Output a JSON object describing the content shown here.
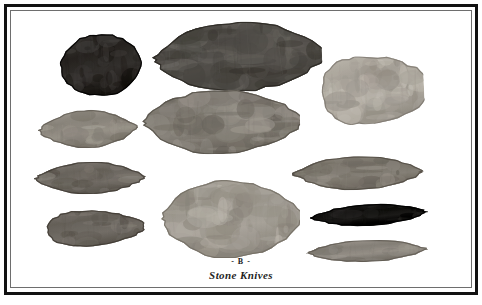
{
  "plate": {
    "letter": "- B -",
    "title": "Stone Knives",
    "background_color": "#ffffff",
    "frame_color": "#111111",
    "frame_inner_color": "#6e6e6e"
  },
  "artifacts": [
    {
      "name": "ovate-blade-dark-top-left",
      "label": "dark ovate blade",
      "tone": "very dark gray",
      "color": "#2e2b28",
      "x": 60,
      "y": 34,
      "width": 82,
      "height": 62,
      "rotation": -4
    },
    {
      "name": "large-leaf-blade-top-center",
      "label": "large leaf-shaped biface",
      "tone": "dark mottled gray",
      "color": "#56534e",
      "x": 150,
      "y": 22,
      "width": 172,
      "height": 70,
      "rotation": -2
    },
    {
      "name": "teardrop-blade-right",
      "label": "teardrop blade",
      "tone": "light gray",
      "color": "#a9a49b",
      "x": 312,
      "y": 56,
      "width": 112,
      "height": 68,
      "rotation": -3
    },
    {
      "name": "elongate-blade-left-upper",
      "label": "elongate blade, tip right",
      "tone": "medium gray",
      "color": "#8d887f",
      "x": 38,
      "y": 110,
      "width": 100,
      "height": 38,
      "rotation": -2
    },
    {
      "name": "large-ovate-blade-center",
      "label": "large ovate blade",
      "tone": "medium gray",
      "color": "#807b73",
      "x": 140,
      "y": 90,
      "width": 160,
      "height": 64,
      "rotation": -1
    },
    {
      "name": "lanceolate-blade-left-middle",
      "label": "slender lanceolate blade",
      "tone": "medium-dark gray",
      "color": "#6f6a63",
      "x": 34,
      "y": 162,
      "width": 112,
      "height": 32,
      "rotation": -1
    },
    {
      "name": "lanceolate-blade-right-middle",
      "label": "long pointed lanceolate blade",
      "tone": "medium gray",
      "color": "#7d786f",
      "x": 292,
      "y": 156,
      "width": 132,
      "height": 34,
      "rotation": -1
    },
    {
      "name": "wedge-blade-bottom-left",
      "label": "wedge-shaped blade",
      "tone": "medium-dark gray",
      "color": "#6b665f",
      "x": 46,
      "y": 206,
      "width": 100,
      "height": 44,
      "rotation": -2
    },
    {
      "name": "large-ovate-biface-bottom-center",
      "label": "large irregular ovate biface",
      "tone": "light gray",
      "color": "#9e9990",
      "x": 158,
      "y": 180,
      "width": 142,
      "height": 78,
      "rotation": 0
    },
    {
      "name": "curved-blade-dark-right",
      "label": "slender curved dark blade",
      "tone": "near black",
      "color": "#171614",
      "x": 310,
      "y": 204,
      "width": 118,
      "height": 22,
      "rotation": -3
    },
    {
      "name": "thin-blade-bottom-right",
      "label": "thin blade with dark tips",
      "tone": "light-medium gray",
      "color": "#8b867e",
      "x": 306,
      "y": 240,
      "width": 122,
      "height": 22,
      "rotation": -2
    }
  ]
}
